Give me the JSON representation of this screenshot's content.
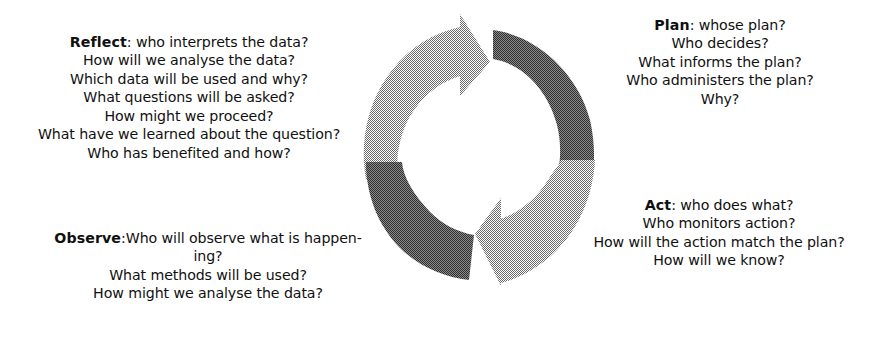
{
  "diagram": {
    "background_color": "#ffffff",
    "text_color": "#101010",
    "cycle": {
      "name": "cyclic-arrows",
      "direction": "clockwise",
      "arrow_count": 2,
      "arrow_light_color": "#8f8f8f",
      "arrow_dark_color": "#5a5a5a",
      "arrows": [
        {
          "name": "top-arrow",
          "points": "clockwise from left, head at top-right",
          "tail_shade": "#5a5a5a",
          "head_shade": "#8f8f8f"
        },
        {
          "name": "bottom-arrow",
          "points": "clockwise from right, head at bottom-left",
          "tail_shade": "#5a5a5a",
          "head_shade": "#8f8f8f"
        }
      ]
    },
    "stages": [
      {
        "id": "reflect",
        "label": "Reflect",
        "separator": ": ",
        "position": "top-left",
        "first_line_rest": "who interprets the data?",
        "lines": [
          "How will we analyse the data?",
          "Which data will be used and why?",
          "What questions will be asked?",
          "How might we proceed?",
          "What have we learned about the question?",
          "Who has benefited and how?"
        ]
      },
      {
        "id": "plan",
        "label": "Plan",
        "separator": ": ",
        "position": "top-right",
        "first_line_rest": "whose plan?",
        "lines": [
          "Who decides?",
          "What informs the plan?",
          "Who administers the plan?",
          "Why?"
        ]
      },
      {
        "id": "observe",
        "label": "Observe",
        "separator": ":",
        "position": "bottom-left",
        "first_line_rest": "Who will observe what is happen-",
        "lines": [
          "ing?",
          "What methods will be used?",
          "How might we analyse the data?"
        ]
      },
      {
        "id": "act",
        "label": "Act",
        "separator": ": ",
        "position": "bottom-right",
        "first_line_rest": "who does what?",
        "lines": [
          "Who monitors action?",
          "How will the action match the plan?",
          "How will we know?"
        ]
      }
    ]
  }
}
